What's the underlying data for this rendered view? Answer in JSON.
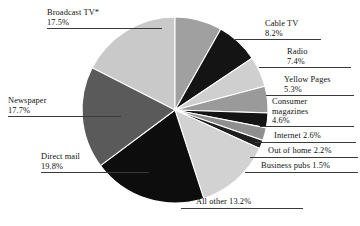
{
  "chart_data": {
    "type": "pie",
    "title": "",
    "subtitle": "",
    "xlabel": "",
    "ylabel": "",
    "legend_position": "none",
    "grid": false,
    "units": "percent",
    "note": "Broadcast TV marked with asterisk",
    "categories": [
      "Broadcast TV*",
      "Cable TV",
      "Radio",
      "Yellow Pages",
      "Consumer magazines",
      "Internet",
      "Out of home",
      "Business pubs",
      "All other",
      "Direct mail",
      "Newspaper"
    ],
    "values": [
      17.5,
      8.2,
      7.4,
      5.3,
      4.6,
      2.6,
      2.2,
      1.5,
      13.2,
      19.8,
      17.7
    ],
    "total": 100.0,
    "slices": [
      {
        "label": "Broadcast TV*",
        "value": 17.5,
        "value_text": "17.5%",
        "color": "#c9c9c9",
        "start_deg": 297.0,
        "end_deg": 360.0
      },
      {
        "label": "Cable TV",
        "value": 8.2,
        "value_text": "8.2%",
        "color": "#a0a0a0",
        "start_deg": 0.0,
        "end_deg": 29.5
      },
      {
        "label": "Radio",
        "value": 7.4,
        "value_text": "7.4%",
        "color": "#141414",
        "start_deg": 29.5,
        "end_deg": 56.1
      },
      {
        "label": "Yellow Pages",
        "value": 5.3,
        "value_text": "5.3%",
        "color": "#cfcfcf",
        "start_deg": 56.1,
        "end_deg": 75.2
      },
      {
        "label": "Consumer magazines",
        "value": 4.6,
        "value_text": "4.6%",
        "color": "#9a9a9a",
        "start_deg": 75.2,
        "end_deg": 91.8
      },
      {
        "label": "Internet",
        "value": 2.6,
        "value_text": "2.6%",
        "color": "#141414",
        "start_deg": 91.8,
        "end_deg": 101.1
      },
      {
        "label": "Out of home",
        "value": 2.2,
        "value_text": "2.2%",
        "color": "#8f8f8f",
        "start_deg": 101.1,
        "end_deg": 109.1
      },
      {
        "label": "Business pubs",
        "value": 1.5,
        "value_text": "1.5%",
        "color": "#1e1e1e",
        "start_deg": 109.1,
        "end_deg": 114.5
      },
      {
        "label": "All other",
        "value": 13.2,
        "value_text": "13.2%",
        "color": "#d2d2d2",
        "start_deg": 114.5,
        "end_deg": 162.0
      },
      {
        "label": "Direct mail",
        "value": 19.8,
        "value_text": "19.8%",
        "color": "#0d0d0d",
        "start_deg": 162.0,
        "end_deg": 233.3
      },
      {
        "label": "Newspaper",
        "value": 17.7,
        "value_text": "17.7%",
        "color": "#5a5a5a",
        "start_deg": 233.3,
        "end_deg": 297.0
      }
    ],
    "center": {
      "x": 175,
      "y": 110
    },
    "radius": 93,
    "background": "#ffffff",
    "slice_border": "#ffffff"
  },
  "labels": {
    "broadcast_tv": {
      "line1": "Broadcast TV*",
      "line2": "17.5%"
    },
    "newspaper": {
      "line1": "Newspaper",
      "line2": "17.7%"
    },
    "direct_mail": {
      "line1": "Direct mail",
      "line2": "19.8%"
    },
    "all_other": {
      "line1": "All other 13.2%"
    },
    "cable_tv": {
      "line1": "Cable TV",
      "line2": "8.2%"
    },
    "radio": {
      "line1": "Radio",
      "line2": "7.4%"
    },
    "yellow_pages": {
      "line1": "Yellow Pages",
      "line2": "5.3%"
    },
    "consumer_magazines": {
      "line1": "Consumer",
      "line2": "magazines",
      "line3": "4.6%"
    },
    "internet": {
      "line1": "Internet  2.6%"
    },
    "out_of_home": {
      "line1": "Out of home 2.2%"
    },
    "business_pubs": {
      "line1": "Business pubs 1.5%"
    }
  }
}
